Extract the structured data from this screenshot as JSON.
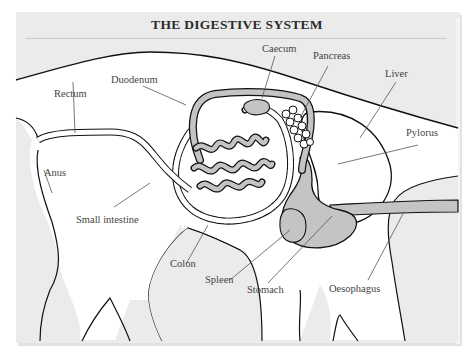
{
  "title": "THE DIGESTIVE SYSTEM",
  "colors": {
    "background": "#ebebeb",
    "body_fill": "#ffffff",
    "organ_fill": "#bfbfbf",
    "outline": "#111111",
    "leader_line": "#555555",
    "label_text": "#444444"
  },
  "labels": {
    "caecum": "Caecum",
    "pancreas": "Pancreas",
    "duodenum": "Duodenum",
    "liver": "Liver",
    "rectum": "Rectum",
    "pylorus": "Pylorus",
    "anus": "Anus",
    "small_intestine": "Small intestine",
    "colon": "Colon",
    "spleen": "Spleen",
    "stomach": "Stomach",
    "oesophagus": "Oesophagus"
  }
}
